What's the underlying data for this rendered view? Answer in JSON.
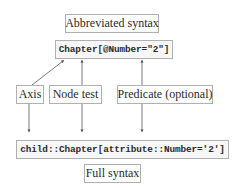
{
  "diagram": {
    "title_top": "Abbreviated syntax",
    "abbreviated_expression": "Chapter[@Number=\"2\"]",
    "parts": [
      {
        "label": "Axis"
      },
      {
        "label": "Node test"
      },
      {
        "label": "Predicate (optional)"
      }
    ],
    "full_expression": "child::Chapter[attribute::Number='2']",
    "title_bottom": "Full syntax"
  },
  "colors": {
    "box_border": "#b0b0b0",
    "line": "#555555",
    "text": "#2a2a2a"
  }
}
